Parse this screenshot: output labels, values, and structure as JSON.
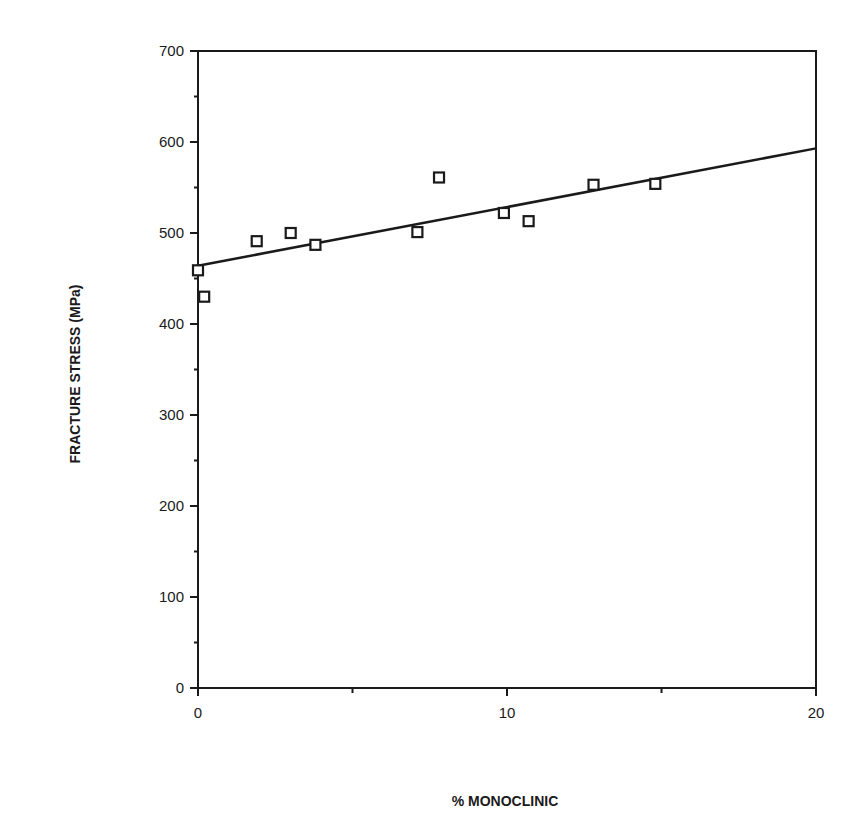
{
  "chart_data": {
    "type": "scatter",
    "title": "",
    "xlabel": "% MONOCLINIC",
    "ylabel": "FRACTURE STRESS (MPa)",
    "xlim": [
      0,
      20
    ],
    "ylim": [
      0,
      700
    ],
    "x_ticks": [
      0,
      10,
      20
    ],
    "x_minor_ticks": [
      5,
      15
    ],
    "y_ticks": [
      0,
      100,
      200,
      300,
      400,
      500,
      600,
      700
    ],
    "y_minor_ticks": [
      50,
      150,
      250,
      350,
      450,
      550,
      650
    ],
    "grid": false,
    "legend": null,
    "series": [
      {
        "name": "Measured",
        "marker": "open-square",
        "points": [
          {
            "x": 0.0,
            "y": 459
          },
          {
            "x": 0.2,
            "y": 430
          },
          {
            "x": 1.9,
            "y": 491
          },
          {
            "x": 3.0,
            "y": 500
          },
          {
            "x": 3.8,
            "y": 487
          },
          {
            "x": 7.1,
            "y": 501
          },
          {
            "x": 7.8,
            "y": 561
          },
          {
            "x": 9.9,
            "y": 522
          },
          {
            "x": 10.7,
            "y": 513
          },
          {
            "x": 12.8,
            "y": 553
          },
          {
            "x": 14.8,
            "y": 554
          }
        ]
      },
      {
        "name": "Linear fit",
        "type": "line",
        "points": [
          {
            "x": 0,
            "y": 464
          },
          {
            "x": 20,
            "y": 593
          }
        ]
      }
    ]
  },
  "colors": {
    "ink": "#1a1a1a",
    "background": "#ffffff"
  }
}
